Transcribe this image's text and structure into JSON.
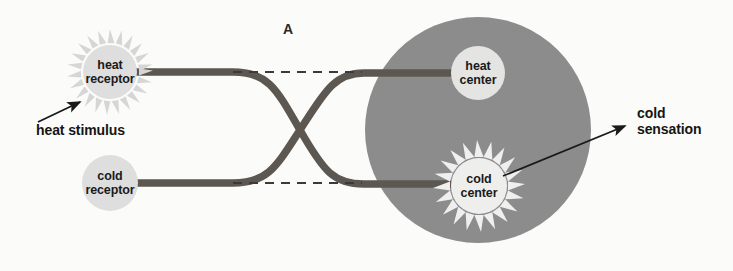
{
  "figure": {
    "panel_letter": "A",
    "background_color": "#fbfbf9"
  },
  "colors": {
    "brain_region": "#8c8c8c",
    "node_fill": "#dedede",
    "nerve_fiber": "#5c5750",
    "ray_light": "#efefef",
    "ray_receptor": "#d5d5d5",
    "dashed_line": "#3a3a3a",
    "arrow": "#1a1a1a",
    "text": "#1a1a1a"
  },
  "nodes": {
    "heat_receptor": {
      "label": "heat\nreceptor",
      "cx": 110,
      "cy": 72,
      "r": 27,
      "has_rays": true,
      "ray_style": "receptor"
    },
    "cold_receptor": {
      "label": "cold\nreceptor",
      "cx": 110,
      "cy": 183,
      "r": 28,
      "has_rays": false,
      "ray_style": "none"
    },
    "heat_center": {
      "label": "heat\ncenter",
      "cx": 478,
      "cy": 73,
      "r": 27,
      "has_rays": false,
      "ray_style": "none"
    },
    "cold_center": {
      "label": "cold\ncenter",
      "cx": 479,
      "cy": 186,
      "r": 28,
      "has_rays": true,
      "ray_style": "center"
    }
  },
  "brain": {
    "name": "brain-region",
    "cx": 478,
    "cy": 130,
    "rx": 113,
    "ry": 113
  },
  "callouts": {
    "heat_stimulus": {
      "label": "heat stimulus",
      "x": 36,
      "y": 124,
      "arrow_from_x": 38,
      "arrow_from_y": 122,
      "arrow_to_x": 82,
      "arrow_to_y": 101
    },
    "cold_sensation": {
      "label": "cold\nsensation",
      "x": 640,
      "y": 108,
      "arrow_from_x": 503,
      "arrow_from_y": 176,
      "arrow_to_x": 627,
      "arrow_to_y": 125
    }
  },
  "pathways": [
    {
      "name": "heat-receptor-to-cold-center",
      "description": "heat receptor fiber crosses down to cold center"
    },
    {
      "name": "cold-receptor-to-heat-center",
      "description": "cold receptor fiber crosses up to heat center"
    }
  ],
  "dashed_guides": [
    {
      "name": "upper-dashed-guide",
      "x1": 233,
      "y1": 72,
      "x2": 362,
      "y2": 72
    },
    {
      "name": "lower-dashed-guide",
      "x1": 233,
      "y1": 183,
      "x2": 362,
      "y2": 183
    }
  ]
}
